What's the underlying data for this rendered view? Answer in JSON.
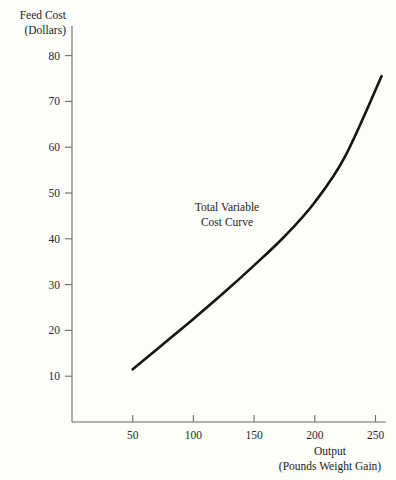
{
  "chart_data": {
    "type": "line",
    "title": "",
    "xlabel": "Output",
    "xlabel_sub": "(Pounds Weight Gain)",
    "ylabel": "Feed Cost",
    "ylabel_sub": "(Dollars)",
    "xlim": [
      0,
      280
    ],
    "ylim": [
      0,
      88
    ],
    "grid": false,
    "legend_position": "none",
    "x_ticks": [
      50,
      100,
      150,
      200,
      250
    ],
    "y_ticks": [
      10,
      20,
      30,
      40,
      50,
      60,
      70,
      80
    ],
    "x_tick_labels": [
      "50",
      "100",
      "150",
      "200",
      "250"
    ],
    "y_tick_labels": [
      "10",
      "20",
      "30",
      "40",
      "50",
      "60",
      "70",
      "80"
    ],
    "annotations": [
      {
        "text_line1": "Total Variable",
        "text_line2": "Cost Curve",
        "x": 150,
        "y": 48
      }
    ],
    "series": [
      {
        "name": "Total Variable Cost Curve",
        "color": "#141414",
        "x": [
          50,
          75,
          100,
          125,
          150,
          175,
          200,
          225,
          255
        ],
        "values": [
          11.5,
          17.0,
          22.5,
          28.2,
          34.2,
          40.5,
          48.0,
          58.0,
          75.5
        ]
      }
    ]
  },
  "axis_colors": {
    "axis": "#6b6b6b",
    "curve": "#141414",
    "background": "#fdfdfa"
  }
}
